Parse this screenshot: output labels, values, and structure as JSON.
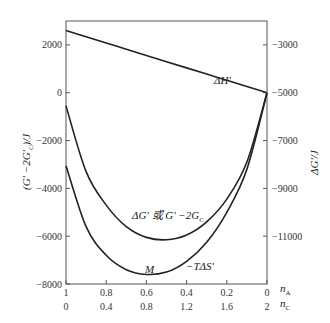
{
  "chart_data": {
    "type": "line",
    "title": "",
    "xlabel_top": "n_A",
    "xlabel_bottom": "n_C",
    "ylabel_left": "(G' -2G'_C)/J",
    "ylabel_right": "ΔG'/J",
    "x_ticks_nA": [
      "1",
      "0.8",
      "0.6",
      "0.4",
      "0.2",
      "0"
    ],
    "x_ticks_nC": [
      "0",
      "0.4",
      "0.8",
      "1.2",
      "1.6",
      "2"
    ],
    "y_left_ticks": [
      "2000",
      "0",
      "-2000",
      "-4000",
      "-6000",
      "-8000"
    ],
    "y_right_ticks": [
      "-3000",
      "-5000",
      "-7000",
      "-9000",
      "-11000"
    ],
    "ylim_left": [
      -8000,
      3000
    ],
    "ylim_right": [
      -13000,
      -2000
    ],
    "grid": false,
    "x": [
      1.0,
      0.9,
      0.8,
      0.7,
      0.6,
      0.5,
      0.4,
      0.3,
      0.2,
      0.1,
      0.0
    ],
    "series": [
      {
        "name": "ΔH'",
        "values": [
          2600,
          2340,
          2080,
          1820,
          1560,
          1300,
          1040,
          780,
          520,
          260,
          0
        ]
      },
      {
        "name": "ΔG' 或 G' -2G°_C",
        "values": [
          -550,
          -3300,
          -4700,
          -5600,
          -6050,
          -6150,
          -5950,
          -5400,
          -4450,
          -2900,
          0
        ]
      },
      {
        "name": "-TΔS'",
        "values": [
          -3050,
          -5600,
          -6800,
          -7400,
          -7600,
          -7500,
          -7050,
          -6250,
          -5000,
          -3200,
          0
        ]
      }
    ],
    "annotations": [
      "ΔH'",
      "ΔG' 或 G' -2G°_C",
      "M",
      "-TΔS'"
    ]
  },
  "labels": {
    "dH": "ΔH'",
    "dG": "ΔG' 或 G' −2G",
    "dG_sup": "°",
    "dG_sub": "C",
    "M": "M",
    "TdS": "−TΔS'",
    "nA": "n",
    "nA_sub": "A",
    "nC": "n",
    "nC_sub": "C",
    "yleft": "(G' −2G'",
    "yleft_sub": "C",
    "yleft_end": ")/J",
    "yright": "ΔG'/J"
  }
}
